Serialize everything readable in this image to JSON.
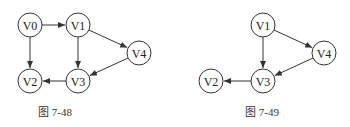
{
  "figures": [
    {
      "caption": "图 7-48",
      "caption_pos": [
        55,
        116
      ],
      "nodes": [
        {
          "id": "V0",
          "label": "V0",
          "x": 30,
          "y": 25
        },
        {
          "id": "V1",
          "label": "V1",
          "x": 78,
          "y": 25
        },
        {
          "id": "V4",
          "label": "V4",
          "x": 139,
          "y": 53
        },
        {
          "id": "V2",
          "label": "V2",
          "x": 30,
          "y": 81
        },
        {
          "id": "V3",
          "label": "V3",
          "x": 78,
          "y": 81
        }
      ],
      "edges": [
        {
          "from": "V0",
          "to": "V1"
        },
        {
          "from": "V0",
          "to": "V2"
        },
        {
          "from": "V1",
          "to": "V3"
        },
        {
          "from": "V1",
          "to": "V4"
        },
        {
          "from": "V4",
          "to": "V3"
        },
        {
          "from": "V3",
          "to": "V2"
        }
      ]
    },
    {
      "caption": "图 7-49",
      "caption_pos": [
        262,
        116
      ],
      "nodes": [
        {
          "id": "V1",
          "label": "V1",
          "x": 263,
          "y": 25
        },
        {
          "id": "V4",
          "label": "V4",
          "x": 324,
          "y": 53
        },
        {
          "id": "V2",
          "label": "V2",
          "x": 211,
          "y": 81
        },
        {
          "id": "V3",
          "label": "V3",
          "x": 263,
          "y": 81
        }
      ],
      "edges": [
        {
          "from": "V1",
          "to": "V3"
        },
        {
          "from": "V1",
          "to": "V4"
        },
        {
          "from": "V4",
          "to": "V3"
        },
        {
          "from": "V3",
          "to": "V2"
        }
      ]
    }
  ],
  "style": {
    "node_radius": 12,
    "stroke": "#333333"
  }
}
